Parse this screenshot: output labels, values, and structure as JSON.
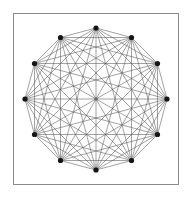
{
  "figure": {
    "type": "graph-diagram",
    "background_color": "#ffffff"
  },
  "frame": {
    "name": "plot-frame",
    "x": 13,
    "y": 13,
    "width": 166,
    "height": 172,
    "border_color": "#8a8a8a",
    "border_width": 1,
    "fill_color": "#ffffff"
  },
  "chart_data": {
    "type": "scatter",
    "title": "",
    "xlabel": "",
    "ylabel": "",
    "grid": false,
    "legend": null,
    "graph": {
      "name": "complete-graph",
      "notation": "K12",
      "vertex_count": 12,
      "edge_count": 66,
      "layout": "circular",
      "center_x": 96,
      "center_y": 99,
      "radius": 71,
      "start_angle_deg": -90,
      "angle_step_deg": 30
    },
    "vertices": [
      {
        "id": 0,
        "angle_deg": -90,
        "x": 96.0,
        "y": 28.0
      },
      {
        "id": 1,
        "angle_deg": -60,
        "x": 131.5,
        "y": 37.5
      },
      {
        "id": 2,
        "angle_deg": -30,
        "x": 157.5,
        "y": 63.5
      },
      {
        "id": 3,
        "angle_deg": 0,
        "x": 167.0,
        "y": 99.0
      },
      {
        "id": 4,
        "angle_deg": 30,
        "x": 157.5,
        "y": 134.5
      },
      {
        "id": 5,
        "angle_deg": 60,
        "x": 131.5,
        "y": 160.5
      },
      {
        "id": 6,
        "angle_deg": 90,
        "x": 96.0,
        "y": 170.0
      },
      {
        "id": 7,
        "angle_deg": 120,
        "x": 60.5,
        "y": 160.5
      },
      {
        "id": 8,
        "angle_deg": 150,
        "x": 34.5,
        "y": 134.5
      },
      {
        "id": 9,
        "angle_deg": 180,
        "x": 25.0,
        "y": 99.0
      },
      {
        "id": 10,
        "angle_deg": 210,
        "x": 34.5,
        "y": 63.5
      },
      {
        "id": 11,
        "angle_deg": 240,
        "x": 60.5,
        "y": 37.5
      }
    ],
    "center_marker": {
      "x": 96,
      "y": 99,
      "r": 1.8,
      "color": "#6b6b6b"
    },
    "style": {
      "edge_color": "#555555",
      "edge_width": 0.55,
      "vertex_color": "#151515",
      "vertex_radius": 2.6
    }
  }
}
